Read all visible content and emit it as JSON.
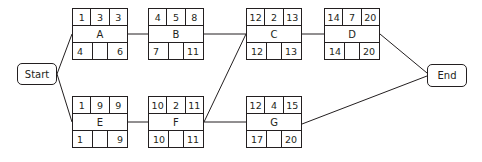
{
  "diagram": {
    "type": "activity-on-node network (critical path)",
    "start_label": "Start",
    "end_label": "End",
    "nodes": {
      "A": {
        "label": "A",
        "es": "1",
        "dur": "3",
        "ef": "3",
        "ls": "4",
        "slack": "",
        "lf": "6"
      },
      "B": {
        "label": "B",
        "es": "4",
        "dur": "5",
        "ef": "8",
        "ls": "7",
        "slack": "",
        "lf": "11"
      },
      "C": {
        "label": "C",
        "es": "12",
        "dur": "2",
        "ef": "13",
        "ls": "12",
        "slack": "",
        "lf": "13"
      },
      "D": {
        "label": "D",
        "es": "14",
        "dur": "7",
        "ef": "20",
        "ls": "14",
        "slack": "",
        "lf": "20"
      },
      "E": {
        "label": "E",
        "es": "1",
        "dur": "9",
        "ef": "9",
        "ls": "1",
        "slack": "",
        "lf": "9"
      },
      "F": {
        "label": "F",
        "es": "10",
        "dur": "2",
        "ef": "11",
        "ls": "10",
        "slack": "",
        "lf": "11"
      },
      "G": {
        "label": "G",
        "es": "12",
        "dur": "4",
        "ef": "15",
        "ls": "17",
        "slack": "",
        "lf": "20"
      }
    },
    "edges": [
      [
        "Start",
        "A"
      ],
      [
        "Start",
        "E"
      ],
      [
        "A",
        "B"
      ],
      [
        "B",
        "C"
      ],
      [
        "C",
        "D"
      ],
      [
        "D",
        "End"
      ],
      [
        "E",
        "F"
      ],
      [
        "F",
        "C"
      ],
      [
        "F",
        "G"
      ],
      [
        "G",
        "End"
      ]
    ]
  }
}
